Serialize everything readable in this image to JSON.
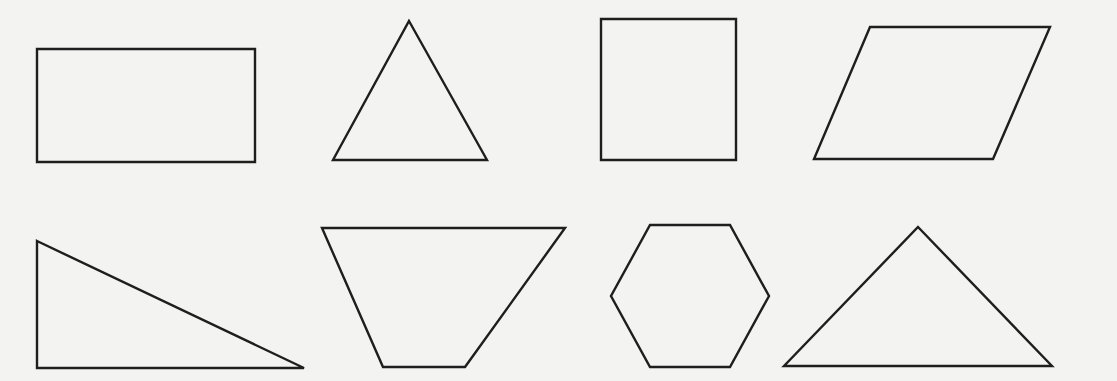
{
  "figure": {
    "background": "#f3f3f2",
    "stroke_color": "#1e1e1e",
    "stroke_width": 2.4,
    "shapes": [
      {
        "name": "rectangle",
        "row": 1,
        "col": 1,
        "points": "37,49 255,49 255,162 37,162"
      },
      {
        "name": "equilateral-triangle",
        "row": 1,
        "col": 2,
        "points": "409,21 487,160 333,160"
      },
      {
        "name": "square",
        "row": 1,
        "col": 3,
        "points": "601,19 736,19 736,160 601,160"
      },
      {
        "name": "parallelogram",
        "row": 1,
        "col": 4,
        "points": "870,27 1050,27 993,159 814,159"
      },
      {
        "name": "right-triangle",
        "row": 2,
        "col": 1,
        "points": "37,241 304,368 37,368"
      },
      {
        "name": "trapezoid",
        "row": 2,
        "col": 2,
        "points": "322,228 565,228 465,367 383,367"
      },
      {
        "name": "hexagon",
        "row": 2,
        "col": 3,
        "points": "650,225 730,225 769,296 730,367 650,367 611,296"
      },
      {
        "name": "obtuse-triangle",
        "row": 2,
        "col": 4,
        "points": "918,227 1052,366 784,366"
      }
    ]
  }
}
